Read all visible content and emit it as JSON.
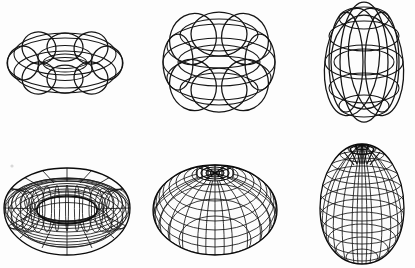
{
  "page": {
    "background_color": "#fdfdfd",
    "stroke_color": "#141414",
    "width": 415,
    "height": 268,
    "rows": 2,
    "columns": 3
  },
  "figures": [
    {
      "id": "wire-ring-torus",
      "name": "Ring torus wireframe",
      "row": "top",
      "column": "left",
      "torus_type": "ring",
      "render_style": "wireframe",
      "meridian_count": 4,
      "parallel_count": 4,
      "tube_radius_ratio": 0.38,
      "center_hole": "open",
      "bbox": {
        "x": 4,
        "y": 16,
        "width": 122,
        "height": 86
      }
    },
    {
      "id": "wire-horn-torus",
      "name": "Horn torus wireframe",
      "row": "top",
      "column": "middle",
      "torus_type": "horn",
      "render_style": "wireframe",
      "meridian_count": 4,
      "parallel_count": 4,
      "tube_radius_ratio": 1.0,
      "center_hole": "closed-to-point",
      "bbox": {
        "x": 160,
        "y": 8,
        "width": 118,
        "height": 104
      }
    },
    {
      "id": "wire-spindle-torus",
      "name": "Spindle torus wireframe",
      "row": "top",
      "column": "right",
      "torus_type": "spindle",
      "render_style": "wireframe",
      "meridian_count": 4,
      "parallel_count": 4,
      "tube_radius_ratio": 1.75,
      "center_hole": "self-intersecting",
      "bbox": {
        "x": 320,
        "y": 2,
        "width": 90,
        "height": 122
      }
    },
    {
      "id": "mesh-ring-torus",
      "name": "Ring torus mesh",
      "row": "bottom",
      "column": "left",
      "torus_type": "ring",
      "render_style": "hidden-line-mesh",
      "meridian_count": 36,
      "parallel_count": 20,
      "tube_radius_ratio": 0.38,
      "center_hole": "open",
      "bbox": {
        "x": 6,
        "y": 166,
        "width": 122,
        "height": 88
      }
    },
    {
      "id": "mesh-horn-torus",
      "name": "Horn torus mesh",
      "row": "bottom",
      "column": "middle",
      "torus_type": "horn",
      "render_style": "hidden-line-mesh",
      "meridian_count": 36,
      "parallel_count": 20,
      "tube_radius_ratio": 1.0,
      "center_hole": "closed-to-point",
      "bbox": {
        "x": 152,
        "y": 160,
        "width": 124,
        "height": 96
      }
    },
    {
      "id": "mesh-spindle-torus",
      "name": "Spindle torus mesh",
      "row": "bottom",
      "column": "right",
      "torus_type": "spindle",
      "render_style": "hidden-line-mesh",
      "meridian_count": 36,
      "parallel_count": 20,
      "tube_radius_ratio": 1.75,
      "center_hole": "self-intersecting",
      "bbox": {
        "x": 318,
        "y": 144,
        "width": 94,
        "height": 124
      }
    }
  ]
}
